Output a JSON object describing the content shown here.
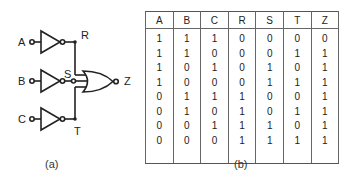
{
  "figure_a": {
    "caption": "(a)",
    "inputs": [
      {
        "label": "A",
        "gate": "NOT",
        "output": "R"
      },
      {
        "label": "B",
        "gate": "NOT",
        "output": "S"
      },
      {
        "label": "C",
        "gate": "NOT",
        "output": "T"
      }
    ],
    "node_labels": {
      "R": "R",
      "S": "S",
      "T": "T"
    },
    "output_gate": "NOR",
    "output_label": "Z"
  },
  "figure_b": {
    "caption": "(b)",
    "headers": [
      "A",
      "B",
      "C",
      "R",
      "S",
      "T",
      "Z"
    ],
    "rows": [
      [
        "1",
        "1",
        "1",
        "0",
        "0",
        "0",
        "0"
      ],
      [
        "1",
        "1",
        "0",
        "0",
        "0",
        "1",
        "1"
      ],
      [
        "1",
        "0",
        "1",
        "0",
        "1",
        "0",
        "1"
      ],
      [
        "1",
        "0",
        "0",
        "0",
        "1",
        "1",
        "1"
      ],
      [
        "0",
        "1",
        "1",
        "1",
        "0",
        "0",
        "1"
      ],
      [
        "0",
        "1",
        "0",
        "1",
        "0",
        "1",
        "1"
      ],
      [
        "0",
        "0",
        "1",
        "1",
        "1",
        "0",
        "1"
      ],
      [
        "0",
        "0",
        "0",
        "1",
        "1",
        "1",
        "1"
      ]
    ]
  }
}
